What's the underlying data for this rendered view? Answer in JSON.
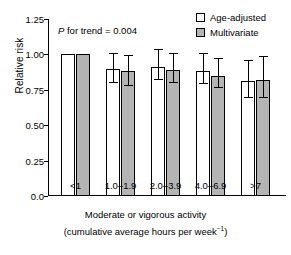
{
  "chart_data": {
    "type": "bar",
    "title": "",
    "xlabel": "Moderate or vigorous activity (cumulative average hours per week⁻¹)",
    "xlabel_line1": "Moderate or vigorous activity",
    "xlabel_line2_prefix": "(cumulative average hours per week",
    "xlabel_line2_sup": "−1",
    "xlabel_line2_suffix": ")",
    "ylabel": "Relative risk",
    "ylim": [
      0.0,
      1.25
    ],
    "yticks": [
      "1.25",
      "1.00",
      "0.75",
      "0.50",
      "0.25",
      "0.0"
    ],
    "ytick_values": [
      1.25,
      1.0,
      0.75,
      0.5,
      0.25,
      0.0
    ],
    "grid": false,
    "legend_position": "top-right",
    "categories": [
      "<1",
      "1.0–1.9",
      "2.0–3.9",
      "4.0–6.9",
      ">7"
    ],
    "series": [
      {
        "name": "Age-adjusted",
        "color": "#ffffff",
        "values": [
          1.0,
          0.9,
          0.91,
          0.88,
          0.81
        ],
        "ci_low": [
          null,
          0.8,
          0.82,
          0.79,
          0.69
        ],
        "ci_high": [
          null,
          1.0,
          1.03,
          1.0,
          0.95
        ]
      },
      {
        "name": "Multivariate",
        "color": "#b4b4b4",
        "values": [
          1.0,
          0.88,
          0.89,
          0.85,
          0.82
        ],
        "ci_low": [
          null,
          0.78,
          0.8,
          0.76,
          0.69
        ],
        "ci_high": [
          null,
          0.99,
          1.0,
          0.97,
          0.98
        ]
      }
    ],
    "annotations": [
      {
        "name": "p-for-trend",
        "italic_part": "P",
        "text": " for trend = 0.004",
        "full_text": "P for trend = 0.004"
      }
    ]
  },
  "legend": {
    "items": [
      {
        "label": "Age-adjusted",
        "swatch": "white-square-icon"
      },
      {
        "label": "Multivariate",
        "swatch": "gray-square-icon"
      }
    ]
  },
  "colors": {
    "bar_age_adjusted": "#ffffff",
    "bar_multivariate": "#b4b4b4",
    "axis": "#000000",
    "background": "#ffffff"
  }
}
